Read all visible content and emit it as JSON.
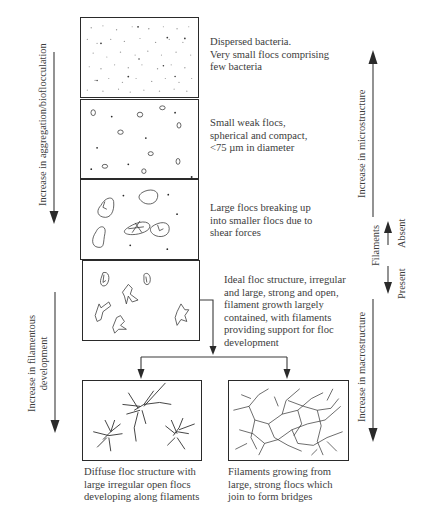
{
  "diagram": {
    "stages": [
      {
        "id": "dispersed",
        "description": "Dispersed bacteria.\nVery small flocs comprising\nfew bacteria"
      },
      {
        "id": "small-weak-flocs",
        "description": "Small weak flocs,\nspherical and compact,\n<75 µm in diameter"
      },
      {
        "id": "large-flocs-breaking",
        "description": "Large flocs breaking up\ninto smaller flocs due to\nshear forces"
      },
      {
        "id": "ideal-floc",
        "description": "Ideal floc structure, irregular\nand large, strong and open,\nfilament growth largely\ncontained, with filaments\nproviding support for floc\ndevelopment"
      },
      {
        "id": "diffuse-floc",
        "description": "Diffuse floc structure with\nlarge irregular open flocs\ndeveloping along filaments"
      },
      {
        "id": "filament-bridging",
        "description": "Filaments growing from\nlarge, strong flocs which\njoin to form bridges"
      }
    ],
    "left_axis": {
      "aggregation_label": "Increase in aggregation/bioflocculation",
      "filamentous_label": "Increase in filamentous\ndevelopment"
    },
    "right_axis": {
      "microstructure_label": "Increase in microstructure",
      "filaments_label": "Filaments",
      "absent_label": "Absent",
      "present_label": "Present",
      "macrostructure_label": "Increase in macrostructure"
    },
    "colors": {
      "line": "#2a2a2a",
      "text": "#3c3c3c",
      "dots": "#8a8a8a"
    }
  }
}
